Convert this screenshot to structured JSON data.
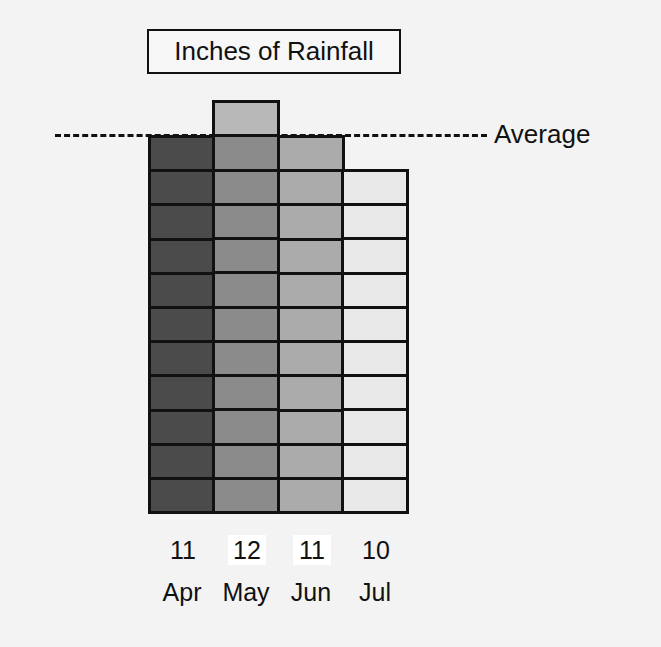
{
  "chart_data": {
    "type": "bar",
    "title": "Inches of Rainfall",
    "categories": [
      "Apr",
      "May",
      "Jun",
      "Jul"
    ],
    "values": [
      11,
      12,
      11,
      10
    ],
    "value_labels": [
      "11",
      "12",
      "11",
      "10"
    ],
    "highlighted_value_labels": [
      false,
      true,
      true,
      false
    ],
    "xlabel": "",
    "ylabel": "",
    "unit_per_cell": 1,
    "reference_line": {
      "label": "Average",
      "value": 11,
      "style": "dashed"
    },
    "bar_colors": [
      "#4b4b4b",
      "#8b8b8b",
      "#ababab",
      "#e9e9e9"
    ],
    "above_average_color": "#b8b8b8",
    "grid": false,
    "legend": null
  }
}
